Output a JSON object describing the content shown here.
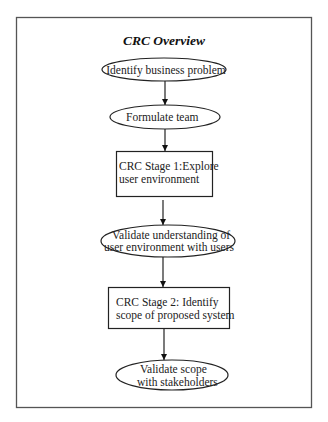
{
  "diagram": {
    "title": "CRC Overview",
    "nodes": [
      {
        "id": "n1",
        "shape": "ellipse",
        "lines": [
          "Identify business problem"
        ]
      },
      {
        "id": "n2",
        "shape": "ellipse",
        "lines": [
          "Formulate team"
        ]
      },
      {
        "id": "n3",
        "shape": "rect",
        "lines": [
          "CRC Stage 1:Explore",
          "user environment"
        ]
      },
      {
        "id": "n4",
        "shape": "ellipse",
        "lines": [
          "Validate understanding of",
          "user environment with users"
        ]
      },
      {
        "id": "n5",
        "shape": "rect",
        "lines": [
          "CRC Stage 2: Identify",
          "scope of proposed system"
        ]
      },
      {
        "id": "n6",
        "shape": "ellipse",
        "lines": [
          "Validate scope",
          "with stakeholders"
        ]
      }
    ],
    "edges": [
      {
        "from": "n1",
        "to": "n2"
      },
      {
        "from": "n2",
        "to": "n3"
      },
      {
        "from": "n3",
        "to": "n4"
      },
      {
        "from": "n4",
        "to": "n5"
      },
      {
        "from": "n5",
        "to": "n6"
      }
    ],
    "colors": {
      "stroke": "#222222",
      "frame": "#555555",
      "background": "#ffffff"
    }
  }
}
